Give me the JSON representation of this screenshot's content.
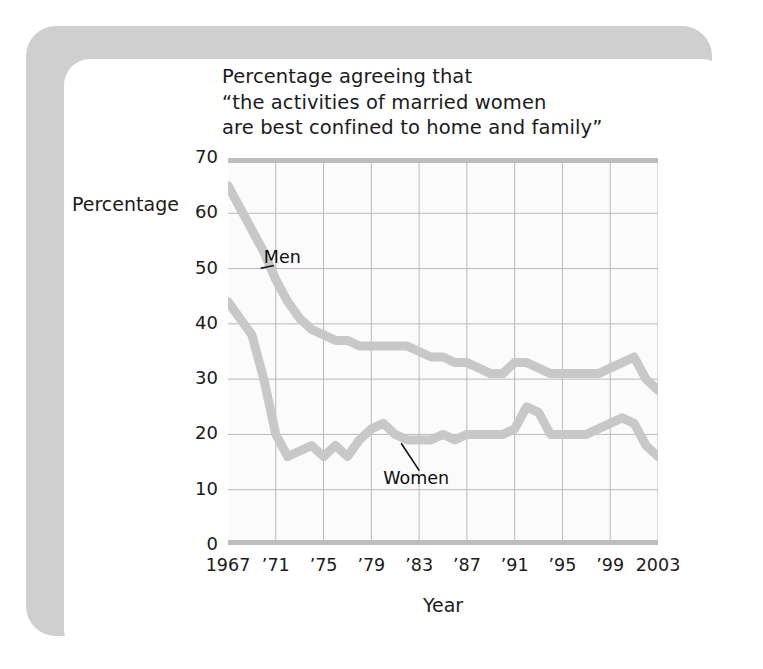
{
  "figure": {
    "title": "Percentage agreeing that\n“the activities of married women\nare best confined to home and family”",
    "y_axis_label": "Percentage",
    "x_axis_label": "Year"
  },
  "chart_data": {
    "type": "line",
    "title": "Percentage agreeing that “the activities of married women are best confined to home and family”",
    "xlabel": "Year",
    "ylabel": "Percentage",
    "xlim": [
      1967,
      2003
    ],
    "ylim": [
      0,
      70
    ],
    "grid": true,
    "legend_position": "inline-annotation",
    "y_ticks": [
      70,
      60,
      50,
      40,
      30,
      20,
      10,
      0
    ],
    "y_tick_labels": [
      "70",
      "60",
      "50",
      "40",
      "30",
      "20",
      "10",
      "0"
    ],
    "x_ticks": [
      1967,
      1971,
      1975,
      1979,
      1983,
      1987,
      1991,
      1995,
      1999,
      2003
    ],
    "x_tick_labels": [
      "1967",
      "’71",
      "’75",
      "’79",
      "’83",
      "’87",
      "’91",
      "’95",
      "’99",
      "2003"
    ],
    "line_color": "#c8c8c8",
    "grid_color": "#b9b9b9",
    "axis_color": "#bdbdbd",
    "series": [
      {
        "name": "Men",
        "x": [
          1967,
          1968,
          1969,
          1970,
          1971,
          1972,
          1973,
          1974,
          1975,
          1976,
          1977,
          1978,
          1979,
          1980,
          1981,
          1982,
          1983,
          1984,
          1985,
          1986,
          1987,
          1988,
          1989,
          1990,
          1991,
          1992,
          1993,
          1994,
          1995,
          1996,
          1997,
          1998,
          1999,
          2000,
          2001,
          2002,
          2003
        ],
        "values": [
          65,
          61,
          57,
          53,
          48,
          44,
          41,
          39,
          38,
          37,
          37,
          36,
          36,
          36,
          36,
          36,
          35,
          34,
          34,
          33,
          33,
          32,
          31,
          31,
          33,
          33,
          32,
          31,
          31,
          31,
          31,
          31,
          32,
          33,
          34,
          30,
          28
        ]
      },
      {
        "name": "Women",
        "x": [
          1967,
          1968,
          1969,
          1970,
          1971,
          1972,
          1973,
          1974,
          1975,
          1976,
          1977,
          1978,
          1979,
          1980,
          1981,
          1982,
          1983,
          1984,
          1985,
          1986,
          1987,
          1988,
          1989,
          1990,
          1991,
          1992,
          1993,
          1994,
          1995,
          1996,
          1997,
          1998,
          1999,
          2000,
          2001,
          2002,
          2003
        ],
        "values": [
          44,
          41,
          38,
          30,
          20,
          16,
          17,
          18,
          16,
          18,
          16,
          19,
          21,
          22,
          20,
          19,
          19,
          19,
          20,
          19,
          20,
          20,
          20,
          20,
          21,
          25,
          24,
          20,
          20,
          20,
          20,
          21,
          22,
          23,
          22,
          18,
          16
        ]
      }
    ],
    "annotations": [
      {
        "text": "Men",
        "series": "Men",
        "x": 1970,
        "y": 52
      },
      {
        "text": "Women",
        "series": "Women",
        "x": 1980,
        "y": 12
      }
    ]
  }
}
